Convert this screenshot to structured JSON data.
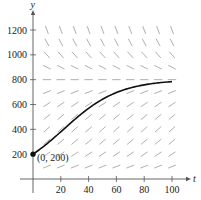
{
  "chart_data": {
    "type": "line",
    "title": "",
    "xlabel": "t",
    "ylabel": "y",
    "xlim": [
      0,
      105
    ],
    "ylim": [
      0,
      1300
    ],
    "x_ticks": [
      20,
      40,
      60,
      80,
      100
    ],
    "y_ticks": [
      200,
      400,
      600,
      800,
      1000,
      1200
    ],
    "grid": false,
    "legend": null,
    "slope_field": {
      "description": "Logistic slope field dy/dt = k*y*(1 - y/800)",
      "t_values": [
        10,
        20,
        30,
        40,
        50,
        60,
        70,
        80,
        90,
        100
      ],
      "y_values": [
        100,
        200,
        300,
        400,
        500,
        600,
        700,
        800,
        900,
        1000,
        1100,
        1200
      ],
      "k": 0.05,
      "carrying_capacity": 800
    },
    "series": [
      {
        "name": "solution curve",
        "model": "y = 800 / (1 + 3e^(-0.05t))",
        "x": [
          0,
          10,
          20,
          30,
          40,
          50,
          60,
          70,
          80,
          90,
          100
        ],
        "values": [
          200,
          284,
          380,
          479,
          569,
          644,
          700,
          738,
          763,
          779,
          788
        ]
      }
    ],
    "annotations": [
      {
        "text": "(0, 200)",
        "x": 0,
        "y": 200
      }
    ]
  },
  "labels": {
    "x_axis": "t",
    "y_axis": "y",
    "point": "(0, 200)",
    "xticks": [
      "20",
      "40",
      "60",
      "80",
      "100"
    ],
    "yticks": [
      "200",
      "400",
      "600",
      "800",
      "1000",
      "1200"
    ]
  },
  "colors": {
    "axis": "#555555",
    "curve": "#111111",
    "slope": "#9a9a9a",
    "text": "#222222"
  }
}
